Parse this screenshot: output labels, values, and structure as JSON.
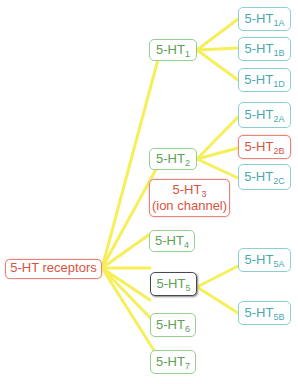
{
  "colors": {
    "root": "#d9533f",
    "level1": "#5aa156",
    "level2": "#49a9b0",
    "highlight": "#d9533f",
    "links": "#f6ef5a"
  },
  "root": {
    "label": "5-HT receptors"
  },
  "level1": [
    {
      "base": "5-HT",
      "sub": "1"
    },
    {
      "base": "5-HT",
      "sub": "2"
    },
    {
      "base": "5-HT",
      "sub": "3",
      "note": "(ion channel)"
    },
    {
      "base": "5-HT",
      "sub": "4"
    },
    {
      "base": "5-HT",
      "sub": "5"
    },
    {
      "base": "5-HT",
      "sub": "6"
    },
    {
      "base": "5-HT",
      "sub": "7"
    }
  ],
  "level2": {
    "ht1": [
      {
        "base": "5-HT",
        "sub": "1A"
      },
      {
        "base": "5-HT",
        "sub": "1B"
      },
      {
        "base": "5-HT",
        "sub": "1D"
      }
    ],
    "ht2": [
      {
        "base": "5-HT",
        "sub": "2A"
      },
      {
        "base": "5-HT",
        "sub": "2B"
      },
      {
        "base": "5-HT",
        "sub": "2C"
      }
    ],
    "ht5": [
      {
        "base": "5-HT",
        "sub": "5A"
      },
      {
        "base": "5-HT",
        "sub": "5B"
      }
    ]
  }
}
